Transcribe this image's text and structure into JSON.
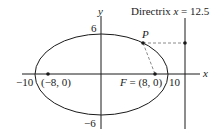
{
  "diagram": {
    "type": "ellipse-with-focus-directrix",
    "axes": {
      "x_label": "x",
      "y_label": "y",
      "x_ticks": [
        "−10",
        "10"
      ],
      "y_ticks": [
        "6",
        "−6"
      ]
    },
    "ellipse": {
      "center": [
        0,
        0
      ],
      "semi_major": 10,
      "semi_minor": 6
    },
    "foci": [
      {
        "label": "(−8, 0)",
        "x": -8,
        "y": 0
      },
      {
        "label_prefix": "F",
        "label": "F = (8, 0)",
        "x": 8,
        "y": 0
      }
    ],
    "point": {
      "label": "P"
    },
    "directrix": {
      "label_word": "Directrix",
      "label_var": "x",
      "label_eq": "= 12.5",
      "x": 12.5
    },
    "colors": {
      "stroke": "#1a1a1a",
      "dashed": "#8a8a8a",
      "background": "#ffffff"
    }
  }
}
